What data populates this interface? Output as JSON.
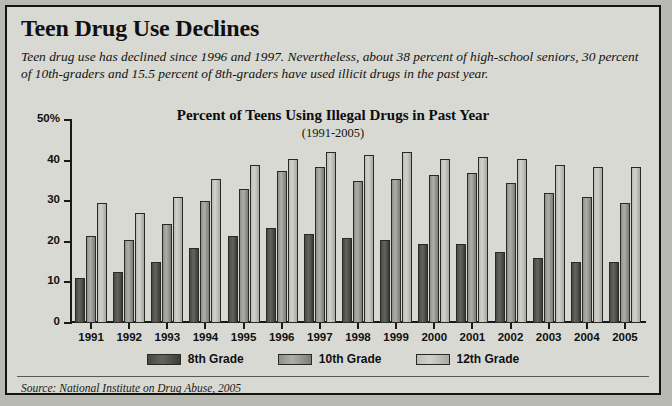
{
  "headline": "Teen Drug Use Declines",
  "deck": "Teen drug use has declined since 1996 and 1997. Nevertheless, about 38 percent of high-school seniors, 30 percent of 10th-graders and 15.5 percent of 8th-graders have used illicit drugs in the past year.",
  "source": "Source: National Institute on Drug Abuse, 2005",
  "legend": [
    {
      "label": "8th Grade",
      "key": "g8"
    },
    {
      "label": "10th Grade",
      "key": "g10"
    },
    {
      "label": "12th Grade",
      "key": "g12"
    }
  ],
  "colors": {
    "page_background": "#b9b9b4",
    "panel_background": "#d9d9d4",
    "frame_border": "#15150f",
    "axis": "#1a1a14",
    "grade8": "#4a4a44",
    "grade10": "#9a9a96",
    "grade12": "#c8c8c3"
  },
  "chart_data": {
    "type": "bar",
    "title": "Percent of Teens Using Illegal Drugs in Past Year",
    "subtitle": "(1991-2005)",
    "xlabel": "",
    "ylabel": "",
    "ylim": [
      0,
      50
    ],
    "yticks": [
      0,
      10,
      20,
      30,
      40,
      50
    ],
    "ytick_labels": [
      "0",
      "10",
      "20",
      "30",
      "40",
      "50%"
    ],
    "grid": false,
    "legend_position": "bottom",
    "categories": [
      "1991",
      "1992",
      "1993",
      "1994",
      "1995",
      "1996",
      "1997",
      "1998",
      "1999",
      "2000",
      "2001",
      "2002",
      "2003",
      "2004",
      "2005"
    ],
    "series": [
      {
        "name": "8th Grade",
        "values": [
          11.0,
          12.5,
          15.0,
          18.5,
          21.5,
          23.5,
          22.0,
          21.0,
          20.5,
          19.5,
          19.5,
          17.5,
          16.0,
          15.0,
          15.0
        ]
      },
      {
        "name": "10th Grade",
        "values": [
          21.5,
          20.5,
          24.5,
          30.0,
          33.0,
          37.5,
          38.5,
          35.0,
          35.5,
          36.5,
          37.0,
          34.5,
          32.0,
          31.0,
          29.5
        ]
      },
      {
        "name": "12th Grade",
        "values": [
          29.5,
          27.0,
          31.0,
          35.5,
          39.0,
          40.5,
          42.0,
          41.5,
          42.0,
          40.5,
          41.0,
          40.5,
          39.0,
          38.5,
          38.5
        ]
      }
    ]
  }
}
